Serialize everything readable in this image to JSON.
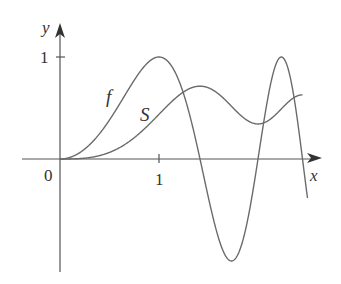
{
  "chart_data": {
    "type": "line",
    "title": "",
    "xlabel": "x",
    "ylabel": "y",
    "x_ticks": [
      "0",
      "1"
    ],
    "y_ticks": [
      "1"
    ],
    "xlim": [
      -0.4,
      2.6
    ],
    "ylim": [
      -1.1,
      1.3
    ],
    "grid": false,
    "legend": "inline labels",
    "series": [
      {
        "name": "f",
        "description": "f(x) = sin(pi x^2 / 2)",
        "x": [
          0,
          0.5,
          1.0,
          1.414,
          1.732,
          2.0,
          2.236,
          2.5
        ],
        "values": [
          0,
          0.38,
          1.0,
          0,
          -1.0,
          0,
          1.0,
          -0.71
        ]
      },
      {
        "name": "S",
        "description": "Fresnel sine integral S(x) = integral_0^x sin(pi t^2/2) dt",
        "x": [
          0,
          0.5,
          1.0,
          1.414,
          1.732,
          2.0,
          2.236,
          2.5
        ],
        "values": [
          0,
          0.065,
          0.438,
          0.714,
          0.549,
          0.343,
          0.553,
          0.619
        ]
      }
    ],
    "annotations": [
      "f",
      "S"
    ]
  },
  "labels": {
    "y_axis": "y",
    "x_axis": "x",
    "origin": "0",
    "x_tick_1": "1",
    "y_tick_1": "1",
    "curve_f": "f",
    "curve_s": "S"
  },
  "colors": {
    "curves": "#6b6b6b",
    "axes": "#555555",
    "text": "#333333"
  }
}
